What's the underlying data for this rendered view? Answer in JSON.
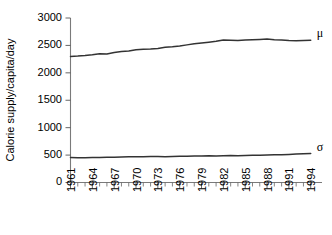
{
  "chart_data": {
    "type": "line",
    "title": "",
    "xlabel": "",
    "ylabel": "Calorie supply/capita/day",
    "xlim": [
      1961,
      1995
    ],
    "ylim": [
      0,
      3000
    ],
    "grid": false,
    "legend_position": "inline-right",
    "y_ticks": [
      0,
      500,
      1000,
      1500,
      2000,
      2500,
      3000
    ],
    "y_tick_labels": [
      "0",
      "500",
      "1000",
      "1500",
      "2000",
      "2500",
      "3000"
    ],
    "x_ticks": [
      1961,
      1962,
      1963,
      1964,
      1965,
      1966,
      1967,
      1968,
      1969,
      1970,
      1971,
      1972,
      1973,
      1974,
      1975,
      1976,
      1977,
      1978,
      1979,
      1980,
      1981,
      1982,
      1983,
      1984,
      1985,
      1986,
      1987,
      1988,
      1989,
      1990,
      1991,
      1992,
      1993,
      1994
    ],
    "x_tick_labels": [
      "1961",
      "1964",
      "1967",
      "1970",
      "1973",
      "1976",
      "1979",
      "1982",
      "1985",
      "1988",
      "1991",
      "1994"
    ],
    "x_label_years": [
      1961,
      1964,
      1967,
      1970,
      1973,
      1976,
      1979,
      1982,
      1985,
      1988,
      1991,
      1994
    ],
    "x": [
      1961,
      1962,
      1963,
      1964,
      1965,
      1966,
      1967,
      1968,
      1969,
      1970,
      1971,
      1972,
      1973,
      1974,
      1975,
      1976,
      1977,
      1978,
      1979,
      1980,
      1981,
      1982,
      1983,
      1984,
      1985,
      1986,
      1987,
      1988,
      1989,
      1990,
      1991,
      1992,
      1993,
      1994
    ],
    "series": [
      {
        "name": "μ",
        "label": "μ",
        "color": "#333333",
        "values": [
          2300,
          2305,
          2315,
          2330,
          2350,
          2345,
          2370,
          2390,
          2400,
          2420,
          2430,
          2435,
          2445,
          2465,
          2475,
          2490,
          2510,
          2530,
          2545,
          2560,
          2575,
          2600,
          2595,
          2590,
          2600,
          2605,
          2610,
          2615,
          2605,
          2600,
          2590,
          2585,
          2590,
          2595
        ]
      },
      {
        "name": "σ",
        "label": "σ",
        "color": "#333333",
        "values": [
          455,
          450,
          452,
          455,
          458,
          462,
          460,
          463,
          468,
          470,
          468,
          472,
          474,
          470,
          474,
          478,
          480,
          482,
          485,
          488,
          484,
          487,
          492,
          490,
          494,
          498,
          495,
          500,
          505,
          508,
          512,
          518,
          524,
          530
        ]
      }
    ]
  }
}
